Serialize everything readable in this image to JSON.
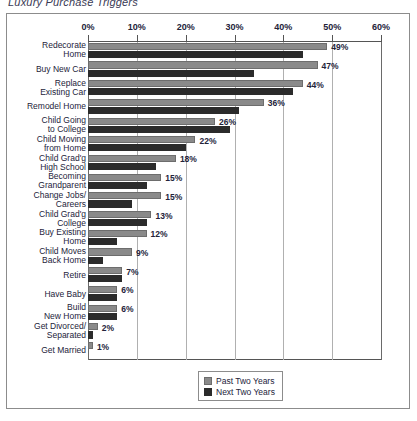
{
  "title": "Luxury Purchase Triggers",
  "legend": {
    "position": "bottom-center",
    "entries": [
      {
        "name": "Past Two Years",
        "color": "#8a8a8a"
      },
      {
        "name": "Next Two Years",
        "color": "#2b2b2b"
      }
    ]
  },
  "axis": {
    "ticks": [
      "0%",
      "10%",
      "20%",
      "30%",
      "40%",
      "50%",
      "60%"
    ],
    "min": 0,
    "max": 60
  },
  "chart_data": {
    "type": "bar",
    "title": "Luxury Purchase Triggers",
    "xlabel": "",
    "ylabel": "",
    "xlim": [
      0,
      60
    ],
    "grid": true,
    "orientation": "horizontal",
    "legend_position": "bottom-center",
    "value_label_suffix": "%",
    "labeled_series": "Past Two Years",
    "categories": [
      "Redecorate Home",
      "Buy New Car",
      "Replace Existing Car",
      "Remodel Home",
      "Child Going to College",
      "Child Moving from Home",
      "Child Grad'g High School",
      "Becoming Grandparent",
      "Change Jobs/ Careers",
      "Child Grad'g College",
      "Buy Existing Home",
      "Child Moves Back Home",
      "Retire",
      "Have Baby",
      "Build New Home",
      "Get Divorced/ Separated",
      "Get Married"
    ],
    "category_lines": [
      [
        "Redecorate",
        "Home"
      ],
      [
        "Buy New Car"
      ],
      [
        "Replace",
        "Existing Car"
      ],
      [
        "Remodel Home"
      ],
      [
        "Child Going",
        "to College"
      ],
      [
        "Child Moving",
        "from Home"
      ],
      [
        "Child Grad'g",
        "High School"
      ],
      [
        "Becoming",
        "Grandparent"
      ],
      [
        "Change Jobs/",
        "Careers"
      ],
      [
        "Child Grad'g",
        "College"
      ],
      [
        "Buy Existing",
        "Home"
      ],
      [
        "Child Moves",
        "Back Home"
      ],
      [
        "Retire"
      ],
      [
        "Have Baby"
      ],
      [
        "Build",
        "New Home"
      ],
      [
        "Get Divorced/",
        "Separated"
      ],
      [
        "Get Married"
      ]
    ],
    "series": [
      {
        "name": "Past Two Years",
        "color": "#8a8a8a",
        "values": [
          49,
          47,
          44,
          36,
          26,
          22,
          18,
          15,
          15,
          13,
          12,
          9,
          7,
          6,
          6,
          2,
          1
        ],
        "value_labels": [
          "49%",
          "47%",
          "44%",
          "36%",
          "26%",
          "22%",
          "18%",
          "15%",
          "15%",
          "13%",
          "12%",
          "9%",
          "7%",
          "6%",
          "6%",
          "2%",
          "1%"
        ]
      },
      {
        "name": "Next Two Years",
        "color": "#2b2b2b",
        "values": [
          44,
          34,
          42,
          31,
          29,
          20,
          14,
          12,
          9,
          12,
          6,
          3,
          7,
          6,
          6,
          1,
          0
        ]
      }
    ]
  }
}
